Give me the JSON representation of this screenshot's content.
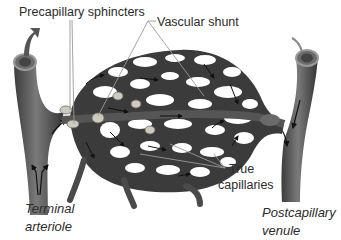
{
  "diagram": {
    "type": "anatomical illustration",
    "labels": {
      "precapillary_sphincters": "Precapillary sphincters",
      "vascular_shunt": "Vascular shunt",
      "true_capillaries_line1": "True",
      "true_capillaries_line2": "capillaries",
      "terminal_arteriole_line1": "Terminal",
      "terminal_arteriole_line2": "arteriole",
      "postcapillary_venule_line1": "Postcapillary",
      "postcapillary_venule_line2": "venule"
    },
    "colors": {
      "vessel_dark": "#3a3a3a",
      "vessel_mid": "#5e5e5e",
      "vessel_light": "#8a8a8a",
      "sphincter": "#c9c4b8",
      "text": "#2b2b2b",
      "leader_line": "#9a9a9a",
      "background": "#ffffff"
    }
  }
}
